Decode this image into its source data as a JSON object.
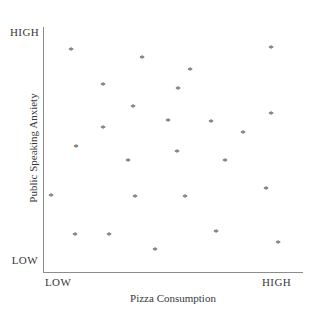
{
  "chart_data": {
    "type": "scatter",
    "title": "",
    "xlabel": "Pizza Consumption",
    "ylabel": "Public Speaking Anxiety",
    "x_tick_labels": [
      "LOW",
      "HIGH"
    ],
    "y_tick_labels": [
      "LOW",
      "HIGH"
    ],
    "xlim": [
      0,
      100
    ],
    "ylim": [
      0,
      100
    ],
    "grid": false,
    "legend": null,
    "marker": "asterisk",
    "marker_glyph": "*",
    "marker_color": "#4b4b4d",
    "axis_color": "#8c8c8c",
    "background_color": "#ffffff",
    "relationship": "no correlation",
    "n_points": 25,
    "points": [
      {
        "x": 10.8,
        "y": 90.6
      },
      {
        "x": 38.1,
        "y": 87.3
      },
      {
        "x": 87.7,
        "y": 91.4
      },
      {
        "x": 23.1,
        "y": 76.3
      },
      {
        "x": 56.5,
        "y": 82.4
      },
      {
        "x": 34.6,
        "y": 67.3
      },
      {
        "x": 48.1,
        "y": 61.6
      },
      {
        "x": 64.6,
        "y": 61.2
      },
      {
        "x": 87.7,
        "y": 64.1
      },
      {
        "x": 23.1,
        "y": 58.4
      },
      {
        "x": 12.7,
        "y": 51.0
      },
      {
        "x": 32.7,
        "y": 45.3
      },
      {
        "x": 51.5,
        "y": 48.6
      },
      {
        "x": 70.0,
        "y": 45.3
      },
      {
        "x": 85.8,
        "y": 33.5
      },
      {
        "x": 35.4,
        "y": 30.6
      },
      {
        "x": 54.6,
        "y": 30.6
      },
      {
        "x": 12.3,
        "y": 14.7
      },
      {
        "x": 25.4,
        "y": 15.1
      },
      {
        "x": 66.5,
        "y": 16.0
      },
      {
        "x": 43.1,
        "y": 8.6
      },
      {
        "x": 90.4,
        "y": 11.8
      },
      {
        "x": 3.1,
        "y": 31.0
      },
      {
        "x": 51.9,
        "y": 74.3
      },
      {
        "x": 76.9,
        "y": 56.7
      }
    ]
  },
  "axes": {
    "y_axis_high_label": "HIGH",
    "y_axis_low_label": "LOW",
    "x_axis_low_label": "LOW",
    "x_axis_high_label": "HIGH",
    "x_axis_title": "Pizza Consumption",
    "y_axis_title": "Public Speaking Anxiety"
  }
}
